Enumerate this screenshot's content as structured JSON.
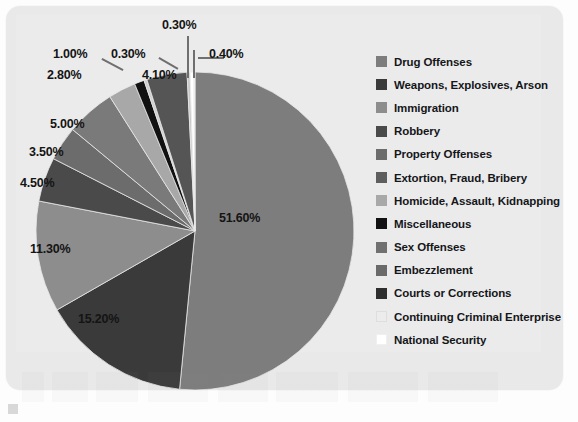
{
  "chart_data": {
    "type": "pie",
    "title": "",
    "subtitle": "",
    "legend_position": "right",
    "grid": false,
    "units": "percent",
    "start_angle_deg": 0,
    "direction": "clockwise",
    "categories": [
      "Drug Offenses",
      "Weapons, Explosives, Arson",
      "Immigration",
      "Robbery",
      "Property Offenses",
      "Extortion, Fraud, Bribery",
      "Homicide, Assault, Kidnapping",
      "Miscellaneous",
      "Sex Offenses",
      "Embezzlement",
      "Courts or Corrections",
      "Continuing Criminal Enterprise",
      "National Security"
    ],
    "values": [
      51.6,
      15.2,
      11.3,
      4.5,
      3.5,
      5.0,
      2.8,
      1.0,
      0.3,
      4.1,
      0.3,
      0.4,
      0.1
    ],
    "value_labels": [
      "51.60%",
      "15.20%",
      "11.30%",
      "4.50%",
      "3.50%",
      "5.00%",
      "2.80%",
      "1.00%",
      "0.30%",
      "4.10%",
      "0.30%",
      "0.40%",
      ""
    ],
    "slice_colors": [
      "#7d7d7d",
      "#3a3a3a",
      "#8d8d8d",
      "#4a4a4a",
      "#6c6c6c",
      "#7a7a7a",
      "#a8a8a8",
      "#111111",
      "#cfcfcf",
      "#555555",
      "#c8c8c8",
      "#ffffff",
      "#fbfbfb"
    ]
  },
  "legend": {
    "items": [
      {
        "label": "Drug Offenses",
        "color": "#7d7d7d"
      },
      {
        "label": "Weapons, Explosives, Arson",
        "color": "#3a3a3a"
      },
      {
        "label": "Immigration",
        "color": "#8d8d8d"
      },
      {
        "label": "Robbery",
        "color": "#4a4a4a"
      },
      {
        "label": "Property Offenses",
        "color": "#6c6c6c"
      },
      {
        "label": "Extortion, Fraud, Bribery",
        "color": "#5e5e5e"
      },
      {
        "label": "Homicide, Assault, Kidnapping",
        "color": "#a8a8a8"
      },
      {
        "label": "Miscellaneous",
        "color": "#111111"
      },
      {
        "label": "Sex Offenses",
        "color": "#707070"
      },
      {
        "label": "Embezzlement",
        "color": "#6a6a6a"
      },
      {
        "label": "Courts or Corrections",
        "color": "#2e2e2e"
      },
      {
        "label": "Continuing Criminal Enterprise",
        "color": "#ececec"
      },
      {
        "label": "National Security",
        "color": "#ffffff"
      }
    ]
  },
  "callouts": [
    {
      "text": "0.30%"
    },
    {
      "text": "1.00%"
    },
    {
      "text": "0.30%"
    },
    {
      "text": "0.40%"
    },
    {
      "text": "2.80%"
    },
    {
      "text": "4.10%"
    },
    {
      "text": "5.00%"
    },
    {
      "text": "3.50%"
    },
    {
      "text": "4.50%"
    },
    {
      "text": "11.30%"
    },
    {
      "text": "15.20%"
    },
    {
      "text": "51.60%"
    }
  ],
  "theme": {
    "card_background": "#e9e9e9",
    "page_background": "#fdfdfd",
    "text_color": "#15161a",
    "leader_color": "#6f6f6f"
  }
}
